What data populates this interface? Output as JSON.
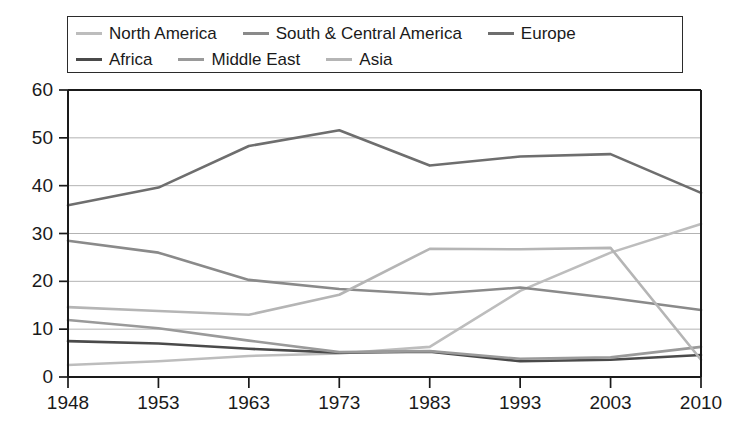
{
  "chart_data": {
    "type": "line",
    "title": "",
    "subtitle": "",
    "xlabel": "",
    "ylabel": "",
    "grid": "horizontal",
    "legend_position": "top",
    "legend_columns": 3,
    "categories": [
      "1948",
      "1953",
      "1963",
      "1973",
      "1983",
      "1993",
      "2003",
      "2010"
    ],
    "x": [
      1948,
      1953,
      1963,
      1973,
      1983,
      1993,
      2003,
      2010
    ],
    "xlim": [
      1948,
      2010
    ],
    "ylim": [
      0,
      60
    ],
    "ytick_labels": [
      "0",
      "10",
      "20",
      "30",
      "40",
      "50",
      "60"
    ],
    "ytick_values": [
      0,
      10,
      20,
      30,
      40,
      50,
      60
    ],
    "series": [
      {
        "name": "North America",
        "color": "#bdbdbd",
        "values": [
          2.5,
          3.3,
          4.4,
          4.9,
          6.3,
          18.0,
          26.0,
          32.0
        ]
      },
      {
        "name": "South & Central America",
        "color": "#8a8a8a",
        "values": [
          28.5,
          26.0,
          20.3,
          18.4,
          17.3,
          18.7,
          16.5,
          14.0
        ]
      },
      {
        "name": "Europe",
        "color": "#6e6e6e",
        "values": [
          35.9,
          39.6,
          48.3,
          51.6,
          44.2,
          46.1,
          46.6,
          38.5
        ]
      },
      {
        "name": "Africa",
        "color": "#4a4a4a",
        "values": [
          7.5,
          7.0,
          5.9,
          5.1,
          5.3,
          3.3,
          3.6,
          4.6
        ]
      },
      {
        "name": "Middle East",
        "color": "#9a9a9a",
        "values": [
          11.9,
          10.2,
          7.6,
          5.2,
          5.4,
          3.8,
          4.1,
          6.3
        ]
      },
      {
        "name": "Asia",
        "color": "#b5b5b5",
        "values": [
          14.6,
          13.8,
          13.0,
          17.2,
          26.8,
          26.7,
          27.0,
          3.6
        ]
      }
    ]
  },
  "legend": {
    "rows": [
      [
        {
          "label": "North America",
          "color": "#bdbdbd"
        },
        {
          "label": "South & Central America",
          "color": "#8a8a8a"
        },
        {
          "label": "Europe",
          "color": "#6e6e6e"
        }
      ],
      [
        {
          "label": "Africa",
          "color": "#4a4a4a"
        },
        {
          "label": "Middle East",
          "color": "#9a9a9a"
        },
        {
          "label": "Asia",
          "color": "#b5b5b5"
        }
      ]
    ]
  },
  "colors": {
    "axis": "#1a1a1a",
    "grid": "#aaaaaa",
    "background": "#ffffff"
  }
}
